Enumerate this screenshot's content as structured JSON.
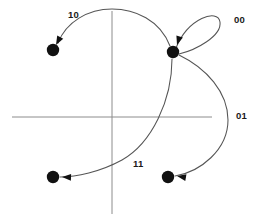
{
  "diagram": {
    "background_color": "#ffffff",
    "axis_color": "#8c8c8c",
    "curve_color": "#555555",
    "node_color": "#111111",
    "label_color": "#1a1a1a",
    "axes": {
      "horizontal": {
        "x1": 12,
        "y1": 117,
        "x2": 212,
        "y2": 117
      },
      "vertical": {
        "x1": 112,
        "y1": 11,
        "x2": 112,
        "y2": 214
      },
      "origin": {
        "x": 112,
        "y": 117
      }
    },
    "nodes": [
      {
        "id": "node-source",
        "label": "",
        "cx": 173,
        "cy": 52,
        "r": 6.2
      },
      {
        "id": "node-top-left",
        "label": "",
        "cx": 53,
        "cy": 50,
        "r": 6.2
      },
      {
        "id": "node-bottom-left",
        "label": "",
        "cx": 53,
        "cy": 177,
        "r": 6.2
      },
      {
        "id": "node-bottom-right",
        "label": "",
        "cx": 168,
        "cy": 177,
        "r": 6.2
      }
    ],
    "edges": [
      {
        "id": "edge-10",
        "label": "10",
        "from": "node-source",
        "to": "node-top-left",
        "label_x": 68,
        "label_y": 18,
        "path": "M 170,46 C 160,20 135,9 112,9 C 88,9 66,22 58,43"
      },
      {
        "id": "edge-00",
        "label": "00",
        "from": "node-source",
        "to": "node-source",
        "label_x": 234,
        "label_y": 23,
        "path": "M 176,48 C 188,18 218,8 220,22 C 222,36 196,50 179,54"
      },
      {
        "id": "edge-01",
        "label": "01",
        "from": "node-source",
        "to": "node-bottom-right",
        "label_x": 236,
        "label_y": 119,
        "path": "M 179,55 C 206,68 228,92 228,120 C 228,150 200,172 175,176"
      },
      {
        "id": "edge-11",
        "label": "11",
        "from": "node-source",
        "to": "node-bottom-left",
        "label_x": 133,
        "label_y": 167,
        "path": "M 172,59 C 172,100 152,143 122,160 C 100,172 76,177 60,177"
      }
    ],
    "arrowheads": [
      {
        "id": "arrow-into-top-left",
        "x": 56,
        "y": 45,
        "angle": 118
      },
      {
        "id": "arrow-into-source-loop",
        "x": 177,
        "y": 45,
        "angle": 107
      },
      {
        "id": "arrow-into-bottom-left",
        "x": 62,
        "y": 177,
        "angle": 182
      },
      {
        "id": "arrow-into-bottom-right",
        "x": 177,
        "y": 176,
        "angle": 190
      }
    ]
  }
}
